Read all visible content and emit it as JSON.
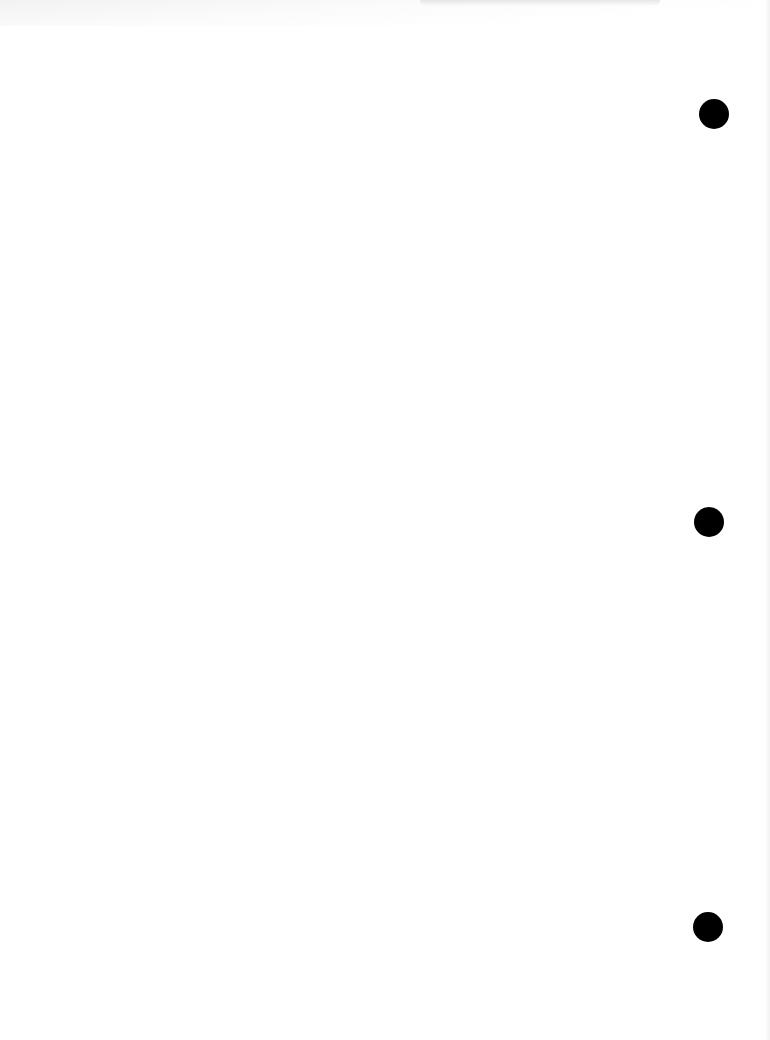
{
  "document": {
    "type": "blank scanned page",
    "background_color": "#ffffff",
    "punch_holes": [
      {
        "position": "top",
        "color": "#000000"
      },
      {
        "position": "middle",
        "color": "#000000"
      },
      {
        "position": "bottom",
        "color": "#000000"
      }
    ]
  }
}
